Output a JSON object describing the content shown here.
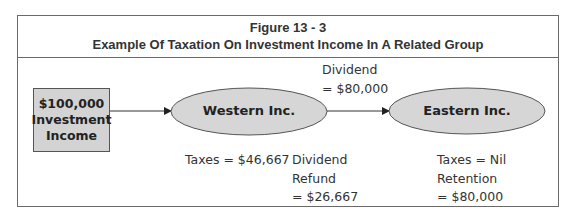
{
  "figure": {
    "number": "Figure 13 - 3",
    "title": "Example Of Taxation On Investment Income In A Related Group"
  },
  "source_box": {
    "lines": [
      "$100,000",
      "Investment",
      "Income"
    ]
  },
  "nodes": [
    {
      "id": "western",
      "label": "Western Inc."
    },
    {
      "id": "eastern",
      "label": "Eastern Inc."
    }
  ],
  "flows": [
    {
      "from": "source",
      "to": "western",
      "label": ""
    },
    {
      "from": "western",
      "to": "eastern",
      "label_lines": [
        "Dividend",
        "= $80,000"
      ]
    }
  ],
  "annotations": {
    "western_taxes": "Taxes = $46,667",
    "dividend_refund": [
      "Dividend",
      "Refund",
      "= $26,667"
    ],
    "eastern": [
      "Taxes = Nil",
      "Retention",
      "= $80,000"
    ]
  },
  "colors": {
    "border": "#6a6a6a",
    "fill": "#d3d3d3",
    "text": "#222222"
  }
}
